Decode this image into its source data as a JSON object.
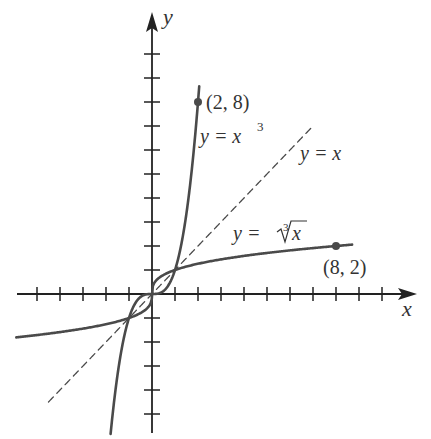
{
  "chart_data": {
    "type": "line",
    "title": "",
    "xlabel": "x",
    "ylabel": "y",
    "xlim": [
      -5.8,
      11.4
    ],
    "ylim": [
      -5.8,
      11.5
    ],
    "x_ticks": [
      -5,
      -4,
      -3,
      -2,
      -1,
      1,
      2,
      3,
      4,
      5,
      6,
      7,
      8,
      9,
      10
    ],
    "y_ticks": [
      -5,
      -4,
      -3,
      -2,
      -1,
      1,
      2,
      3,
      4,
      5,
      6,
      7,
      8,
      9,
      10
    ],
    "grid": false,
    "series": [
      {
        "name": "y = x^3",
        "label": "y = x",
        "label_sup": "3",
        "style": "solid",
        "x_range": [
          -1.8,
          2.2
        ]
      },
      {
        "name": "y = x",
        "label": "y = x",
        "style": "dashed",
        "x_range": [
          -4.5,
          7
        ]
      },
      {
        "name": "y = cbrt(x)",
        "label": "y = ",
        "label_root": "x",
        "root_index": "3",
        "style": "solid",
        "x_range": [
          -5.9,
          8.7
        ]
      }
    ],
    "points": [
      {
        "label": "(2, 8)",
        "x": 2,
        "y": 8
      },
      {
        "label": "(8, 2)",
        "x": 8,
        "y": 2
      }
    ]
  },
  "colors": {
    "axis": "#222222",
    "curve": "#4a4a4a",
    "text": "#333333"
  }
}
